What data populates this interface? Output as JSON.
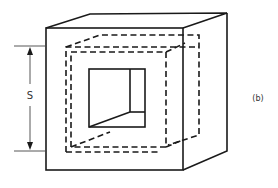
{
  "figure": {
    "panel_label": "(b)",
    "dimension_label": "S"
  },
  "colors": {
    "line": "#1a1a1a",
    "background": "#ffffff",
    "label": "#333333"
  }
}
